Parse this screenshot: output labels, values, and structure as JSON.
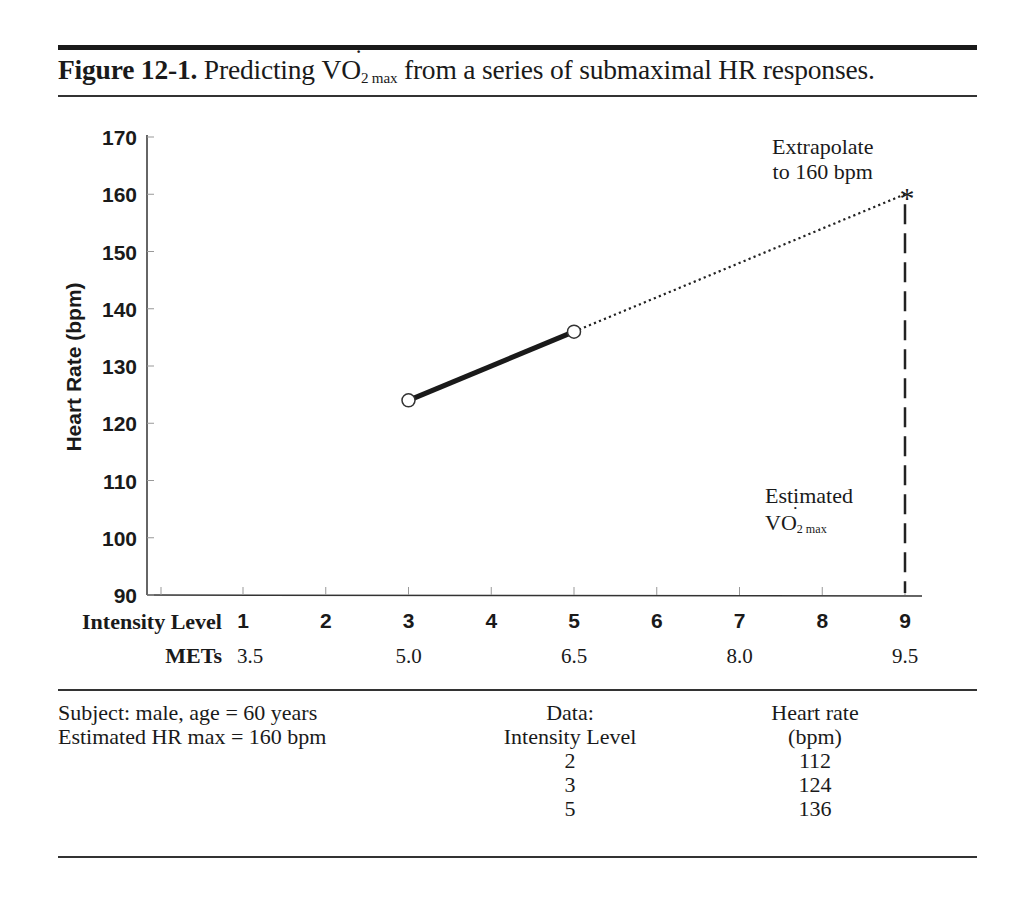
{
  "figure": {
    "label": "Figure 12-1.",
    "title_prefix": "Predicting ",
    "title_vo2_main": "VO",
    "title_vo2_sub": "2 max",
    "title_suffix": " from a series of submaximal HR responses."
  },
  "annotations": {
    "extrapolate_line1": "Extrapolate",
    "extrapolate_line2": "to 160 bpm",
    "asterisk": "*",
    "estimated_line1": "Estimated",
    "estimated_vo2_main": "VO",
    "estimated_vo2_sub": "2 max"
  },
  "footer": {
    "subject_line1": "Subject: male, age = 60 years",
    "subject_line2": "Estimated HR max = 160 bpm",
    "table": {
      "col1_header_line1": "Data:",
      "col1_header_line2": "Intensity Level",
      "col2_header_line1": "Heart rate",
      "col2_header_line2": "(bpm)",
      "rows": [
        {
          "intensity": "2",
          "hr": "112"
        },
        {
          "intensity": "3",
          "hr": "124"
        },
        {
          "intensity": "5",
          "hr": "136"
        }
      ]
    }
  },
  "chart_data": {
    "type": "line",
    "xlabel": "Intensity Level",
    "x2label": "METs",
    "ylabel": "Heart Rate (bpm)",
    "ylim": [
      90,
      170
    ],
    "yticks": [
      90,
      100,
      110,
      120,
      130,
      140,
      150,
      160,
      170
    ],
    "xticks": [
      1,
      2,
      3,
      4,
      5,
      6,
      7,
      8,
      9
    ],
    "mets_ticks": [
      {
        "level": 1,
        "label": "3.5"
      },
      {
        "level": 3,
        "label": "5.0"
      },
      {
        "level": 5,
        "label": "6.5"
      },
      {
        "level": 7,
        "label": "8.0"
      },
      {
        "level": 9,
        "label": "9.5"
      }
    ],
    "grid": false,
    "series": [
      {
        "name": "Measured HR",
        "style": "solid-thick",
        "marker": "open-circle",
        "points": [
          {
            "x": 3,
            "y": 124
          },
          {
            "x": 5,
            "y": 136
          }
        ]
      },
      {
        "name": "Extrapolation",
        "style": "dotted",
        "points": [
          {
            "x": 5,
            "y": 136
          },
          {
            "x": 9,
            "y": 160
          }
        ]
      },
      {
        "name": "Estimated VO2max drop line",
        "style": "dashed-vertical",
        "points": [
          {
            "x": 9,
            "y": 160
          },
          {
            "x": 9,
            "y": 90
          }
        ]
      }
    ],
    "table_data": [
      {
        "intensity_level": 2,
        "heart_rate_bpm": 112
      },
      {
        "intensity_level": 3,
        "heart_rate_bpm": 124
      },
      {
        "intensity_level": 5,
        "heart_rate_bpm": 136
      }
    ],
    "hr_max_bpm": 160
  }
}
